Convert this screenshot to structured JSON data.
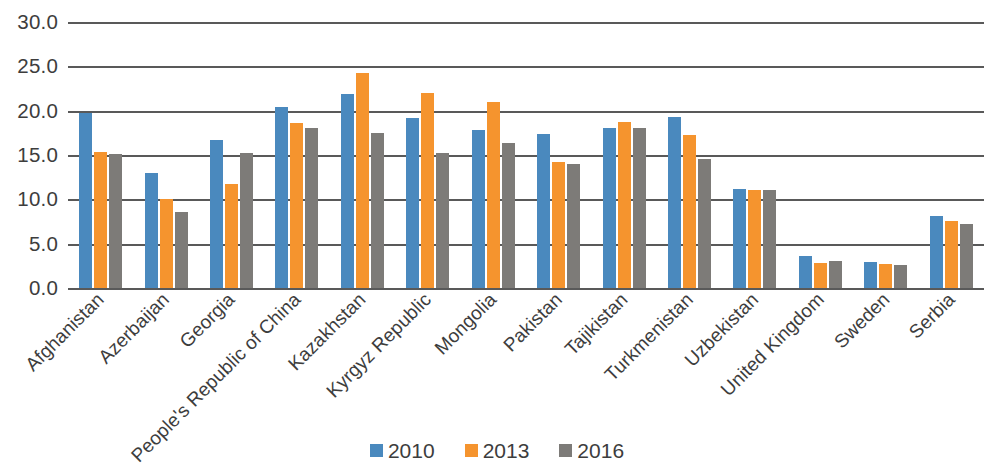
{
  "chart_data": {
    "type": "bar",
    "title": "",
    "subtitle": "",
    "xlabel": "",
    "ylabel": "",
    "ylim": [
      0.0,
      30.0
    ],
    "ytick_step": 5.0,
    "ytick_labels": [
      "30.0",
      "25.0",
      "20.0",
      "15.0",
      "10.0",
      "5.0",
      "0.0"
    ],
    "ytick_values": [
      30.0,
      25.0,
      20.0,
      15.0,
      10.0,
      5.0,
      0.0
    ],
    "grid": true,
    "grid_axis": "y",
    "legend_position": "bottom-center",
    "xtick_rotation": -45,
    "categories": [
      "Afghanistan",
      "Azerbaijan",
      "Georgia",
      "People's Republic of China",
      "Kazakhstan",
      "Kyrgyz Republic",
      "Mongolia",
      "Pakistan",
      "Tajikistan",
      "Turkmenistan",
      "Uzbekistan",
      "United Kingdom",
      "Sweden",
      "Serbia"
    ],
    "series": [
      {
        "name": "2010",
        "color": "#4a89be",
        "values": [
          19.7,
          13.0,
          16.7,
          20.4,
          21.9,
          19.2,
          17.8,
          17.4,
          18.0,
          19.3,
          11.2,
          3.6,
          2.9,
          8.1
        ]
      },
      {
        "name": "2013",
        "color": "#f5942e",
        "values": [
          15.3,
          10.0,
          11.7,
          18.6,
          24.2,
          22.0,
          21.0,
          14.2,
          18.7,
          17.3,
          11.1,
          2.8,
          2.7,
          7.6
        ]
      },
      {
        "name": "2016",
        "color": "#7d7b78",
        "values": [
          15.1,
          8.6,
          15.2,
          18.1,
          17.5,
          15.2,
          16.4,
          14.0,
          18.0,
          14.5,
          11.1,
          3.0,
          2.6,
          7.2
        ]
      }
    ]
  },
  "legend": {
    "items": [
      {
        "label": "2010",
        "color": "#4a89be"
      },
      {
        "label": "2013",
        "color": "#f5942e"
      },
      {
        "label": "2016",
        "color": "#7d7b78"
      }
    ]
  }
}
